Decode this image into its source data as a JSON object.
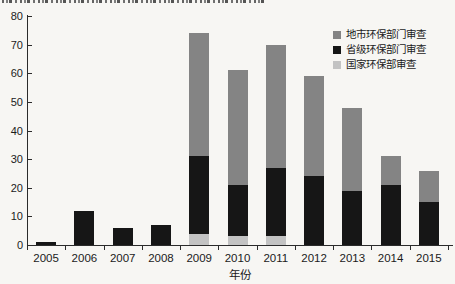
{
  "page": {
    "background_color": "#f7f6f3",
    "top_edge_clipped_text": "illegible caption cut off at top edge"
  },
  "chart_data": {
    "type": "bar",
    "stacked": true,
    "title": "",
    "xlabel": "年份",
    "ylabel": "",
    "ylim": [
      0,
      80
    ],
    "yticks": [
      0,
      10,
      20,
      30,
      40,
      50,
      60,
      70,
      80
    ],
    "grid": false,
    "legend_position": "top-right",
    "categories": [
      "2005",
      "2006",
      "2007",
      "2008",
      "2009",
      "2010",
      "2011",
      "2012",
      "2013",
      "2014",
      "2015"
    ],
    "series": [
      {
        "key": "national",
        "name": "国家环保部审查",
        "color": "#c3c3c3",
        "values": [
          0,
          0,
          0,
          0,
          4,
          3,
          3,
          0,
          0,
          0,
          0
        ]
      },
      {
        "key": "provincial",
        "name": "省级环保部门审查",
        "color": "#161616",
        "values": [
          1,
          12,
          6,
          7,
          27,
          18,
          24,
          24,
          19,
          21,
          15
        ]
      },
      {
        "key": "municipal",
        "name": "地市环保部门审查",
        "color": "#848484",
        "values": [
          0,
          0,
          0,
          0,
          43,
          40,
          43,
          35,
          29,
          10,
          11
        ]
      }
    ],
    "totals": [
      1,
      12,
      6,
      7,
      74,
      61,
      70,
      59,
      48,
      31,
      26
    ]
  },
  "legend": {
    "items": [
      {
        "key": "municipal",
        "label": "地市环保部门审查",
        "color": "#848484"
      },
      {
        "key": "provincial",
        "label": "省级环保部门审查",
        "color": "#161616"
      },
      {
        "key": "national",
        "label": "国家环保部审查",
        "color": "#c3c3c3"
      }
    ]
  }
}
